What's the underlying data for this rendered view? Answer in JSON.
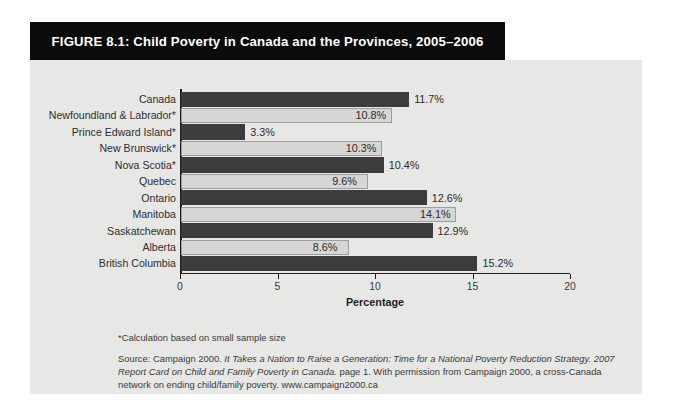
{
  "figure": {
    "title": "FIGURE 8.1: Child Poverty in Canada and the Provinces, 2005–2006",
    "footnote": "*Calculation based on small sample size",
    "source": {
      "lead": "Source: Campaign 2000. ",
      "italic_1": "It Takes a Nation to Raise a Generation: Time for a National Poverty Reduction Strategy. 2007 Report Card on Child and Family Poverty in Canada.",
      "tail": " page 1. With permission from Campaign 2000, a cross-Canada network on ending child/family poverty. www.campaign2000.ca"
    }
  },
  "chart_data": {
    "type": "bar",
    "orientation": "horizontal",
    "title": "FIGURE 8.1: Child Poverty in Canada and the Provinces, 2005–2006",
    "xlabel": "Percentage",
    "ylabel": "",
    "xlim": [
      0,
      20
    ],
    "xticks": [
      0,
      5,
      10,
      15,
      20
    ],
    "xtick_labels": [
      "0",
      "5",
      "10",
      "15",
      "20"
    ],
    "grid": false,
    "legend": "none",
    "value_suffix": "%",
    "categories": [
      "Canada",
      "Newfoundland & Labrador*",
      "Prince Edward Island*",
      "New Brunswick*",
      "Nova Scotia*",
      "Quebec",
      "Ontario",
      "Manitoba",
      "Saskatchewan",
      "Alberta",
      "British Columbia"
    ],
    "values": [
      11.7,
      10.8,
      3.3,
      10.3,
      10.4,
      9.6,
      12.6,
      14.1,
      12.9,
      8.6,
      15.2
    ],
    "value_labels": [
      "11.7%",
      "10.8%",
      "3.3%",
      "10.3%",
      "10.4%",
      "9.6%",
      "12.6%",
      "14.1%",
      "12.9%",
      "8.6%",
      "15.2%"
    ],
    "bar_styles": [
      "dark",
      "light",
      "dark",
      "light",
      "dark",
      "light",
      "dark",
      "light",
      "dark",
      "light",
      "dark"
    ],
    "colors": {
      "bar_dark": "#3c3c3c",
      "bar_light": "#d6d6d4",
      "bar_light_border": "#9e9e9c",
      "panel_background": "#e7e7e5",
      "title_bar": "#0b0b0b",
      "title_text": "#ffffff",
      "axis": "#1b1b1b",
      "text": "#2e2e2e"
    }
  }
}
